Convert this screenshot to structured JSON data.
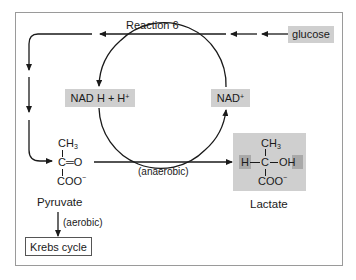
{
  "diagram": {
    "top_label": "Reaction 6",
    "source": "glucose",
    "cofactor_reduced": {
      "main": "NAD",
      "rest": "H + H",
      "sup": "+"
    },
    "cofactor_oxidized": {
      "main": "NAD",
      "sup": "+"
    },
    "pyruvate": {
      "name": "Pyruvate",
      "top": "CH",
      "top_sub": "3",
      "middle": "C═O",
      "bottom": "COO",
      "bottom_sup": "−"
    },
    "lactate": {
      "name": "Lactate",
      "top": "CH",
      "top_sub": "3",
      "left": "H",
      "center": "C",
      "right": "OH",
      "bottom": "COO",
      "bottom_sup": "−"
    },
    "anaerobic_label": "(anaerobic)",
    "aerobic_label": "(aerobic)",
    "krebs": "Krebs cycle",
    "colors": {
      "highlight_box": "#cfcfcf",
      "highlight_dark": "#a9a9a9",
      "line": "#1a1a1a",
      "frame": "#9a9a9a"
    }
  }
}
